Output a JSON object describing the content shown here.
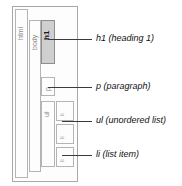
{
  "diagram": {
    "type": "nested-box-dom-tree",
    "colors": {
      "background": "#ffffff",
      "box_border": "#b4b4b4",
      "outer_border": "#a8a8a8",
      "highlight_fill": "#cfcfcf",
      "highlight_border": "#8e8e8e",
      "leader_line": "#3a3a3a",
      "tag_text": "#8a8a8a",
      "caption_text": "#111111"
    },
    "boxes": [
      {
        "tag": "html",
        "label": "html",
        "highlighted": false
      },
      {
        "tag": "body",
        "label": "body",
        "highlighted": false
      },
      {
        "tag": "h1",
        "label": "h1",
        "highlighted": true
      },
      {
        "tag": "p",
        "label": "p",
        "highlighted": false
      },
      {
        "tag": "ul",
        "label": "ul",
        "highlighted": false
      },
      {
        "tag": "li",
        "label": "li",
        "highlighted": false
      },
      {
        "tag": "li",
        "label": "li",
        "highlighted": false
      },
      {
        "tag": "li",
        "label": "li",
        "highlighted": false
      }
    ],
    "annotations": [
      {
        "id": "h1",
        "text": "h1 (heading 1)"
      },
      {
        "id": "p",
        "text": "p (paragraph)"
      },
      {
        "id": "ul",
        "text": "ul (unordered list)"
      },
      {
        "id": "li",
        "text": "li (list item)"
      }
    ]
  }
}
